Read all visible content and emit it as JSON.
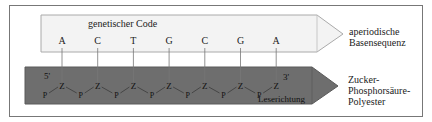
{
  "diagram": {
    "top_strand": {
      "title": "genetischer Code",
      "bases": [
        "A",
        "C",
        "T",
        "G",
        "C",
        "G",
        "A"
      ],
      "side_label_lines": [
        "aperiodische",
        "Basensequenz"
      ],
      "fill": "#f3f3f3"
    },
    "bottom_strand": {
      "end_5": "5'",
      "end_3": "3'",
      "backbone": [
        "P",
        "Z",
        "P",
        "Z",
        "P",
        "Z",
        "P",
        "Z",
        "P",
        "Z",
        "P",
        "Z",
        "P",
        "Z"
      ],
      "sugar_label": "Z",
      "phosphate_label": "P",
      "direction_label": "Leserichtung",
      "side_label_lines": [
        "Zucker-",
        "Phosphorsäure-",
        "Polyester"
      ],
      "fill": "#6e6e6e"
    },
    "colors": {
      "frame": "#555555",
      "line": "#666666",
      "text": "#222222"
    }
  }
}
